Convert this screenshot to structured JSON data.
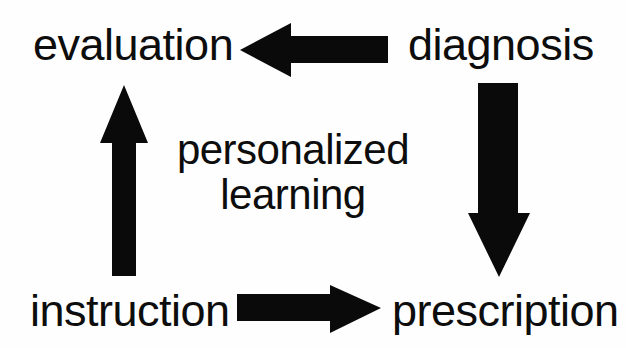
{
  "diagram": {
    "type": "cycle-flow-diagram",
    "title": "personalized learning",
    "background_color": "#fefefe",
    "ink_color": "#0a0a0a",
    "center": {
      "line1": "personalized",
      "line2": "learning"
    },
    "nodes": [
      {
        "id": "evaluation",
        "label": "evaluation",
        "position": "top-left"
      },
      {
        "id": "diagnosis",
        "label": "diagnosis",
        "position": "top-right"
      },
      {
        "id": "prescription",
        "label": "prescription",
        "position": "bottom-right"
      },
      {
        "id": "instruction",
        "label": "instruction",
        "position": "bottom-left"
      }
    ],
    "arrows": [
      {
        "id": "diagnosis-to-evaluation",
        "icon": "arrow-left-icon",
        "from": "diagnosis",
        "to": "evaluation",
        "direction": "left"
      },
      {
        "id": "diagnosis-to-prescription",
        "icon": "arrow-down-icon",
        "from": "diagnosis",
        "to": "prescription",
        "direction": "down"
      },
      {
        "id": "instruction-to-prescription",
        "icon": "arrow-right-icon",
        "from": "instruction",
        "to": "prescription",
        "direction": "right"
      },
      {
        "id": "instruction-to-evaluation",
        "icon": "arrow-up-icon",
        "from": "instruction",
        "to": "evaluation",
        "direction": "up"
      }
    ]
  }
}
